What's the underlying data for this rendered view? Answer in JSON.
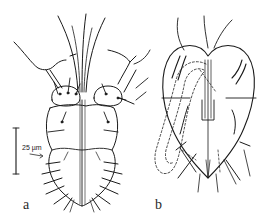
{
  "figure": {
    "panels": [
      {
        "id": "a",
        "label": "a",
        "view": "dorsal"
      },
      {
        "id": "b",
        "label": "b",
        "view": "ventral"
      }
    ],
    "scale_bar": {
      "label": "25 µm",
      "length_um": 25
    },
    "colors": {
      "ink": "#1a1a1a",
      "background": "#ffffff"
    }
  }
}
